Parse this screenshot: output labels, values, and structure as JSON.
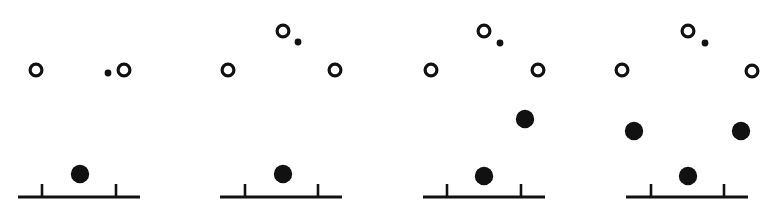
{
  "figure": {
    "width": 774,
    "height": 221,
    "background_color": "#ffffff",
    "ink_color": "#111111",
    "panel_count": 4,
    "marker_legend": {
      "open_circle": "open-circle-marker",
      "small_dot": "small-dot-marker",
      "filled_circle": "filled-circle-marker"
    },
    "geometry": {
      "open_circle_radius": 7.5,
      "open_circle_stroke": 3.2,
      "small_dot_radius": 3.4,
      "filled_circle_radius": 9.2,
      "baseline_stroke": 3.0,
      "tick_stroke": 2.6,
      "tick_height": 13
    },
    "panels": [
      {
        "index": 1,
        "name": "panel-1",
        "baseline": {
          "x1": 18,
          "x2": 140,
          "y": 197
        },
        "ticks": [
          {
            "x": 42
          },
          {
            "x": 116
          }
        ],
        "open_circles": [
          {
            "cx": 36,
            "cy": 70
          },
          {
            "cx": 124,
            "cy": 70
          }
        ],
        "small_dots": [
          {
            "cx": 108,
            "cy": 73
          }
        ],
        "filled_circles": [
          {
            "cx": 80,
            "cy": 174
          }
        ]
      },
      {
        "index": 2,
        "name": "panel-2",
        "baseline": {
          "x1": 220,
          "x2": 342,
          "y": 197
        },
        "ticks": [
          {
            "x": 245
          },
          {
            "x": 318
          }
        ],
        "open_circles": [
          {
            "cx": 283,
            "cy": 31
          },
          {
            "cx": 228,
            "cy": 70
          },
          {
            "cx": 335,
            "cy": 70
          }
        ],
        "small_dots": [
          {
            "cx": 298,
            "cy": 42
          }
        ],
        "filled_circles": [
          {
            "cx": 283,
            "cy": 174
          }
        ]
      },
      {
        "index": 3,
        "name": "panel-3",
        "baseline": {
          "x1": 423,
          "x2": 545,
          "y": 197
        },
        "ticks": [
          {
            "x": 447
          },
          {
            "x": 521
          }
        ],
        "open_circles": [
          {
            "cx": 484,
            "cy": 31
          },
          {
            "cx": 431,
            "cy": 70
          },
          {
            "cx": 538,
            "cy": 70
          }
        ],
        "small_dots": [
          {
            "cx": 500,
            "cy": 43
          }
        ],
        "filled_circles": [
          {
            "cx": 525,
            "cy": 119
          },
          {
            "cx": 484,
            "cy": 176
          }
        ]
      },
      {
        "index": 4,
        "name": "panel-4",
        "baseline": {
          "x1": 626,
          "x2": 748,
          "y": 197
        },
        "ticks": [
          {
            "x": 651
          },
          {
            "x": 724
          }
        ],
        "open_circles": [
          {
            "cx": 688,
            "cy": 31
          },
          {
            "cx": 622,
            "cy": 70
          },
          {
            "cx": 752,
            "cy": 71
          }
        ],
        "small_dots": [
          {
            "cx": 705,
            "cy": 43
          }
        ],
        "filled_circles": [
          {
            "cx": 634,
            "cy": 131
          },
          {
            "cx": 741,
            "cy": 131
          },
          {
            "cx": 688,
            "cy": 176
          }
        ]
      }
    ]
  }
}
